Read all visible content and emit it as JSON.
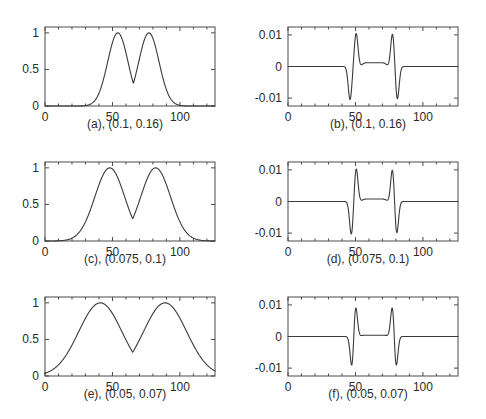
{
  "figure": {
    "background_color": "#ffffff",
    "line_color": "#3a3a3a",
    "axis_color": "#4a4a4a",
    "rows": 3,
    "cols": 2
  },
  "chart_data": [
    {
      "type": "line",
      "panel_id": "a",
      "title": "",
      "caption": "(a), (0.1, 0.16)",
      "xlabel": "",
      "ylabel": "",
      "xlim": [
        0,
        126
      ],
      "ylim": [
        0,
        1.08
      ],
      "xticks": [
        0,
        50,
        100
      ],
      "xticklabels": [
        "0",
        "50",
        "100"
      ],
      "yticks": [
        0,
        0.5,
        1
      ],
      "yticklabels": [
        "0",
        "0.5",
        "1"
      ],
      "grid": false,
      "legend": "none",
      "params": [
        0.1,
        0.16
      ],
      "description": "two gaussian-like pulses",
      "peaks": [
        {
          "x": 54,
          "y": 1,
          "sigma": 7.5
        },
        {
          "x": 77,
          "y": 1,
          "sigma": 7.5
        }
      ],
      "baseline": 0
    },
    {
      "type": "line",
      "panel_id": "b",
      "title": "",
      "caption": "(b), (0.1, 0.16)",
      "xlabel": "",
      "ylabel": "",
      "xlim": [
        0,
        126
      ],
      "ylim": [
        -0.0125,
        0.0125
      ],
      "xticks": [
        0,
        50,
        100
      ],
      "xticklabels": [
        "0",
        "50",
        "100"
      ],
      "yticks": [
        -0.01,
        0,
        0.01
      ],
      "yticklabels": [
        "-0.01",
        "0",
        "0.01"
      ],
      "grid": false,
      "legend": "none",
      "params": [
        0.1,
        0.16
      ],
      "description": "derivative-like bipolar spikes with raised plateau between pairs",
      "negative_spikes": [
        {
          "x": 46,
          "y": -0.0105
        },
        {
          "x": 81,
          "y": -0.0105
        }
      ],
      "positive_spikes": [
        {
          "x": 50.5,
          "y": 0.0105
        },
        {
          "x": 77.5,
          "y": 0.0105
        }
      ],
      "plateau": {
        "from": 55,
        "to": 73,
        "y": 0.0012
      },
      "baseline": 0
    },
    {
      "type": "line",
      "panel_id": "c",
      "title": "",
      "caption": "(c), (0.075, 0.1)",
      "xlabel": "",
      "ylabel": "",
      "xlim": [
        0,
        126
      ],
      "ylim": [
        0,
        1.08
      ],
      "xticks": [
        0,
        50,
        100
      ],
      "xticklabels": [
        "0",
        "50",
        "100"
      ],
      "yticks": [
        0,
        0.5,
        1
      ],
      "yticklabels": [
        "0",
        "0.5",
        "1"
      ],
      "grid": false,
      "legend": "none",
      "params": [
        0.075,
        0.1
      ],
      "description": "two broader gaussian-like pulses",
      "peaks": [
        {
          "x": 48,
          "y": 1,
          "sigma": 11
        },
        {
          "x": 82,
          "y": 1,
          "sigma": 11
        }
      ],
      "baseline": 0
    },
    {
      "type": "line",
      "panel_id": "d",
      "title": "",
      "caption": "(d), (0.075, 0.1)",
      "xlabel": "",
      "ylabel": "",
      "xlim": [
        0,
        126
      ],
      "ylim": [
        -0.0125,
        0.0125
      ],
      "xticks": [
        0,
        50,
        100
      ],
      "xticklabels": [
        "0",
        "50",
        "100"
      ],
      "yticks": [
        -0.01,
        0,
        0.01
      ],
      "yticklabels": [
        "-0.01",
        "0",
        "0.01"
      ],
      "grid": false,
      "legend": "none",
      "params": [
        0.075,
        0.1
      ],
      "description": "sharper bipolar spikes with small raised plateau between pairs",
      "negative_spikes": [
        {
          "x": 47,
          "y": -0.0106
        },
        {
          "x": 80.5,
          "y": -0.0106
        }
      ],
      "positive_spikes": [
        {
          "x": 50.5,
          "y": 0.0106
        },
        {
          "x": 77.5,
          "y": 0.0106
        }
      ],
      "plateau": {
        "from": 55,
        "to": 73,
        "y": 0.0008
      },
      "baseline": 0
    },
    {
      "type": "line",
      "panel_id": "e",
      "title": "",
      "caption": "(e), (0.05, 0.07)",
      "xlabel": "",
      "ylabel": "",
      "xlim": [
        0,
        126
      ],
      "ylim": [
        0,
        1.08
      ],
      "xticks": [
        0,
        50,
        100
      ],
      "xticklabels": [
        "0",
        "50",
        "100"
      ],
      "yticks": [
        0,
        0.5,
        1
      ],
      "yticklabels": [
        "0",
        "0.5",
        "1"
      ],
      "grid": false,
      "legend": "none",
      "params": [
        0.05,
        0.07
      ],
      "description": "two widest gaussian-like pulses, nonzero at both edges",
      "peaks": [
        {
          "x": 41,
          "y": 1,
          "sigma": 16
        },
        {
          "x": 89,
          "y": 1,
          "sigma": 16
        }
      ],
      "baseline": 0.04
    },
    {
      "type": "line",
      "panel_id": "f",
      "title": "",
      "caption": "(f), (0.05, 0.07)",
      "xlabel": "",
      "ylabel": "",
      "xlim": [
        0,
        126
      ],
      "ylim": [
        -0.0125,
        0.0125
      ],
      "xticks": [
        0,
        50,
        100
      ],
      "xticklabels": [
        "0",
        "50",
        "100"
      ],
      "yticks": [
        -0.01,
        0,
        0.01
      ],
      "yticklabels": [
        "-0.01",
        "0",
        "0.01"
      ],
      "grid": false,
      "legend": "none",
      "params": [
        0.05,
        0.07
      ],
      "description": "narrowest sharp bipolar spikes, flat zero elsewhere",
      "negative_spikes": [
        {
          "x": 47.5,
          "y": -0.0105
        },
        {
          "x": 80,
          "y": -0.0105
        }
      ],
      "positive_spikes": [
        {
          "x": 50,
          "y": 0.0105
        },
        {
          "x": 77.5,
          "y": 0.0105
        }
      ],
      "plateau": {
        "from": 54,
        "to": 74,
        "y": 0.0004
      },
      "baseline": 0
    }
  ]
}
